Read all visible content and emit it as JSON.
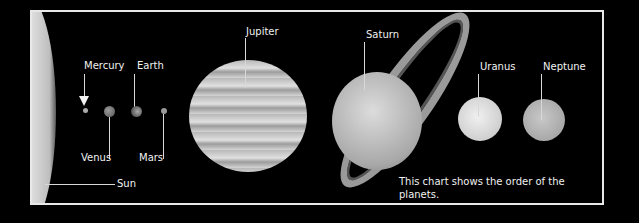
{
  "title": "Order of the Planets",
  "sun": {
    "label": "Sun"
  },
  "planets": [
    {
      "name": "Mercury"
    },
    {
      "name": "Venus"
    },
    {
      "name": "Earth"
    },
    {
      "name": "Mars"
    },
    {
      "name": "Jupiter"
    },
    {
      "name": "Saturn"
    },
    {
      "name": "Uranus"
    },
    {
      "name": "Neptune"
    }
  ],
  "caption": {
    "line1": "This chart shows the order of the planets.",
    "line2": "Mercury is closest to the sun."
  },
  "colors": {
    "background": "#000000",
    "frame": "#e8e8e8",
    "text": "#f2f2f2"
  }
}
